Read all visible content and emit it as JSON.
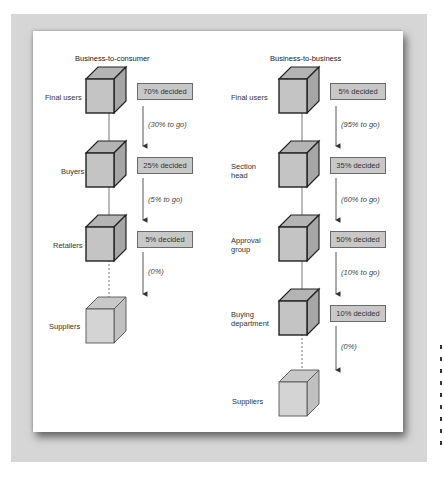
{
  "diagram": {
    "columns": [
      {
        "title": "Business-to-consumer",
        "nodes": [
          {
            "label": "Final users",
            "decided": "70% decided",
            "to_go": "(30% to go)",
            "style": "solid"
          },
          {
            "label": "Buyers",
            "decided": "25% decided",
            "to_go": "(5% to go)",
            "style": "solid"
          },
          {
            "label": "Retailers",
            "decided": "5% decided",
            "to_go": "(0%)",
            "style": "solid"
          },
          {
            "label": "Suppliers",
            "decided": null,
            "to_go": null,
            "style": "light"
          }
        ]
      },
      {
        "title": "Business-to-business",
        "nodes": [
          {
            "label": "Final users",
            "decided": "5% decided",
            "to_go": "(95% to go)",
            "style": "solid"
          },
          {
            "label": "Section head",
            "label_lines": [
              "Section",
              "head"
            ],
            "decided": "35% decided",
            "to_go": "(60% to go)",
            "style": "solid"
          },
          {
            "label": "Approval group",
            "label_lines": [
              "Approval",
              "group"
            ],
            "decided": "50% decided",
            "to_go": "(10% to go)",
            "style": "solid"
          },
          {
            "label": "Buying department",
            "label_lines": [
              "Buying",
              "department"
            ],
            "decided": "10% decided",
            "to_go": "(0%)",
            "style": "solid"
          },
          {
            "label": "Suppliers",
            "decided": null,
            "to_go": null,
            "style": "light"
          }
        ]
      }
    ]
  },
  "colors": {
    "cube_front": "#c0c0c0",
    "cube_top": "#b0b0b0",
    "cube_side": "#a8a8a8",
    "cube_light": "#d2d2d2",
    "box_fill": "#c8c8c8",
    "frame": "#d6d6d6"
  }
}
